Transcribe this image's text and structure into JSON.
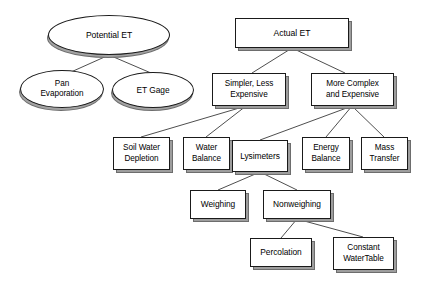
{
  "diagram": {
    "canvas": {
      "width": 421,
      "height": 283,
      "background": "#ffffff"
    },
    "style": {
      "node_fill": "#ffffff",
      "node_stroke": "#1a1a1a",
      "shadow_color": "#6d6d6d",
      "edge_color": "#3a3a3a"
    },
    "nodes": [
      {
        "id": "potential-et",
        "label": "Potential ET",
        "shape": "ellipse",
        "x": 48,
        "y": 15,
        "w": 122,
        "h": 40,
        "font_size": 8.6
      },
      {
        "id": "pan-evaporation",
        "label": "Pan\nEvaporation",
        "shape": "ellipse",
        "x": 20,
        "y": 70,
        "w": 84,
        "h": 38,
        "font_size": 8.2
      },
      {
        "id": "et-gage",
        "label": "ET Gage",
        "shape": "ellipse",
        "x": 112,
        "y": 72,
        "w": 82,
        "h": 36,
        "font_size": 8.4
      },
      {
        "id": "actual-et",
        "label": "Actual ET",
        "shape": "box",
        "x": 235,
        "y": 18,
        "w": 114,
        "h": 30,
        "font_size": 8.6
      },
      {
        "id": "simpler-less-expensive",
        "label": "Simpler, Less\nExpensive",
        "shape": "box",
        "x": 212,
        "y": 73,
        "w": 74,
        "h": 33,
        "font_size": 8.2
      },
      {
        "id": "more-complex-and-expensive",
        "label": "More Complex\nand Expensive",
        "shape": "box",
        "x": 311,
        "y": 73,
        "w": 83,
        "h": 33,
        "font_size": 8.2
      },
      {
        "id": "soil-water-depletion",
        "label": "Soil Water\nDepletion",
        "shape": "box",
        "x": 113,
        "y": 137,
        "w": 57,
        "h": 33,
        "font_size": 8.2
      },
      {
        "id": "water-balance",
        "label": "Water\nBalance",
        "shape": "box",
        "x": 183,
        "y": 137,
        "w": 47,
        "h": 33,
        "font_size": 8.2
      },
      {
        "id": "lysimeters",
        "label": "Lysimeters",
        "shape": "box",
        "x": 232,
        "y": 140,
        "w": 56,
        "h": 32,
        "font_size": 8.4
      },
      {
        "id": "energy-balance",
        "label": "Energy\nBalance",
        "shape": "box",
        "x": 302,
        "y": 137,
        "w": 48,
        "h": 33,
        "font_size": 8.2
      },
      {
        "id": "mass-transfer",
        "label": "Mass\nTransfer",
        "shape": "box",
        "x": 361,
        "y": 137,
        "w": 47,
        "h": 33,
        "font_size": 8.2
      },
      {
        "id": "weighing",
        "label": "Weighing",
        "shape": "box",
        "x": 190,
        "y": 190,
        "w": 56,
        "h": 29,
        "font_size": 8.4
      },
      {
        "id": "nonweighing",
        "label": "Nonweighing",
        "shape": "box",
        "x": 263,
        "y": 190,
        "w": 68,
        "h": 29,
        "font_size": 8.4
      },
      {
        "id": "percolation",
        "label": "Percolation",
        "shape": "box",
        "x": 250,
        "y": 238,
        "w": 62,
        "h": 29,
        "font_size": 8.4
      },
      {
        "id": "constant-watertable",
        "label": "Constant\nWaterTable",
        "shape": "box",
        "x": 333,
        "y": 237,
        "w": 61,
        "h": 33,
        "font_size": 8.2
      }
    ],
    "edges": [
      {
        "id": "edge-potential-pan",
        "from": "potential-et",
        "to": "pan-evaporation",
        "x1": 109,
        "y1": 55,
        "x2": 71,
        "y2": 72
      },
      {
        "id": "edge-potential-etgage",
        "from": "potential-et",
        "to": "et-gage",
        "x1": 109,
        "y1": 55,
        "x2": 151,
        "y2": 73
      },
      {
        "id": "edge-actual-simpler",
        "from": "actual-et",
        "to": "simpler-less-expensive",
        "x1": 292,
        "y1": 48,
        "x2": 252,
        "y2": 73
      },
      {
        "id": "edge-actual-complex",
        "from": "actual-et",
        "to": "more-complex-and-expensive",
        "x1": 292,
        "y1": 48,
        "x2": 345,
        "y2": 73
      },
      {
        "id": "edge-simpler-soilwater",
        "from": "simpler-less-expensive",
        "to": "soil-water-depletion",
        "x1": 246,
        "y1": 106,
        "x2": 141,
        "y2": 137
      },
      {
        "id": "edge-simpler-waterbalance",
        "from": "simpler-less-expensive",
        "to": "water-balance",
        "x1": 246,
        "y1": 106,
        "x2": 206,
        "y2": 137
      },
      {
        "id": "edge-complex-lysimeters",
        "from": "more-complex-and-expensive",
        "to": "lysimeters",
        "x1": 352,
        "y1": 106,
        "x2": 260,
        "y2": 140
      },
      {
        "id": "edge-complex-energy",
        "from": "more-complex-and-expensive",
        "to": "energy-balance",
        "x1": 352,
        "y1": 106,
        "x2": 326,
        "y2": 137
      },
      {
        "id": "edge-complex-mass",
        "from": "more-complex-and-expensive",
        "to": "mass-transfer",
        "x1": 352,
        "y1": 106,
        "x2": 384,
        "y2": 137
      },
      {
        "id": "edge-lysimeters-weighing",
        "from": "lysimeters",
        "to": "weighing",
        "x1": 260,
        "y1": 172,
        "x2": 218,
        "y2": 190
      },
      {
        "id": "edge-lysimeters-nonweigh",
        "from": "lysimeters",
        "to": "nonweighing",
        "x1": 260,
        "y1": 172,
        "x2": 297,
        "y2": 190
      },
      {
        "id": "edge-nonweigh-percolation",
        "from": "nonweighing",
        "to": "percolation",
        "x1": 297,
        "y1": 219,
        "x2": 281,
        "y2": 238
      },
      {
        "id": "edge-nonweigh-constant",
        "from": "nonweighing",
        "to": "constant-watertable",
        "x1": 297,
        "y1": 219,
        "x2": 363,
        "y2": 237
      }
    ]
  }
}
